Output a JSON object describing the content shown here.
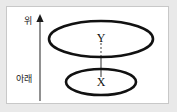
{
  "figure": {
    "background_color": "#e9e9e9",
    "panel_color": "#ffffff",
    "panel_border_color": "#c8c8c8",
    "stroke_color": "#111111",
    "axis_color": "#555555"
  },
  "axis": {
    "name": "vertical-direction-arrow",
    "top_label": "위",
    "bottom_label": "아래",
    "direction": "up",
    "x": 38,
    "y_top": 17,
    "y_bottom": 100
  },
  "shapes": {
    "upper_ellipse": {
      "name": "upper-ellipse",
      "cx": 99,
      "cy": 38,
      "rx": 52,
      "ry": 18,
      "stroke_width": 2.6
    },
    "lower_ellipse": {
      "name": "lower-ellipse",
      "cx": 99,
      "cy": 81,
      "rx": 35,
      "ry": 13,
      "stroke_width": 2.6
    }
  },
  "nodes": [
    {
      "name": "node-y",
      "label": "Y",
      "x": 99,
      "y": 38
    },
    {
      "name": "node-x",
      "label": "X",
      "x": 99,
      "y": 81
    }
  ],
  "connector": {
    "name": "connector-line",
    "x": 99,
    "dashed_from": 42,
    "dashed_to": 55,
    "solid_from": 55,
    "solid_to": 75,
    "dash_pattern": "2,2",
    "color": "#6b6b6b"
  }
}
